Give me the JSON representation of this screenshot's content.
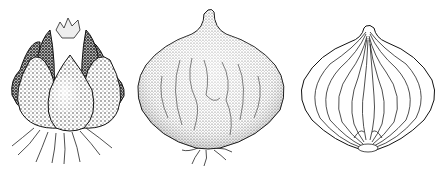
{
  "image": {
    "description": "Botanical pen-and-ink illustration of three onion/bulb views on white background",
    "background": "#ffffff",
    "ink_color": "#1a1a1a",
    "figures": [
      {
        "id": "shallot-cluster",
        "subject": "clustered bulb (shallot) with roots, stippled shading"
      },
      {
        "id": "whole-onion",
        "subject": "whole onion bulb with neck and small roots, stippled shading"
      },
      {
        "id": "onion-cross-section",
        "subject": "longitudinal cross-section of onion showing concentric layers"
      }
    ]
  }
}
